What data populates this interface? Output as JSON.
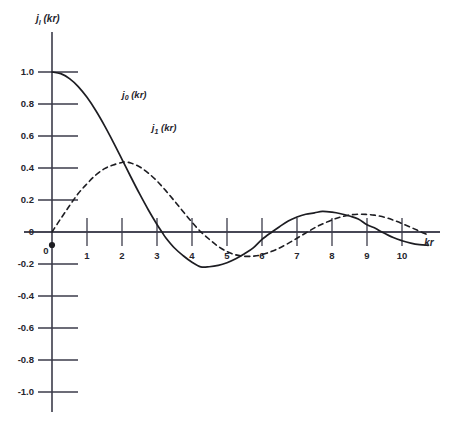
{
  "chart_data": {
    "type": "line",
    "title": "",
    "subtitle": "",
    "xlabel": "kr",
    "ylabel": "j (kr)",
    "xlim": [
      0,
      10.8
    ],
    "ylim": [
      -1.0,
      1.0
    ],
    "grid": false,
    "legend_position": "inline-annotation",
    "x_ticks": [
      "0",
      "1",
      "2",
      "3",
      "4",
      "5",
      "6",
      "7",
      "8",
      "9",
      "10"
    ],
    "x_tick_values": [
      0,
      1,
      2,
      3,
      4,
      5,
      6,
      7,
      8,
      9,
      10
    ],
    "y_ticks": [
      "1.0",
      "0.8",
      "0.6",
      "0.4",
      "0.2",
      "0",
      "-0.2",
      "-0.4",
      "-0.6",
      "-0.8",
      "-1.0"
    ],
    "y_tick_values": [
      1.0,
      0.8,
      0.6,
      0.4,
      0.2,
      0,
      -0.2,
      -0.4,
      -0.6,
      -0.8,
      -1.0
    ],
    "series": [
      {
        "name": "j0 (kr)",
        "name_base": "j",
        "name_sub": "0",
        "name_arg": " (kr)",
        "style": "solid",
        "label_x": 2.0,
        "label_y": 0.84,
        "x": [
          0.0,
          0.25,
          0.5,
          0.75,
          1.0,
          1.25,
          1.5,
          1.75,
          2.0,
          2.25,
          2.5,
          2.75,
          3.0,
          3.1416,
          3.25,
          3.5,
          3.75,
          4.0,
          4.25,
          4.4934,
          4.75,
          5.0,
          5.25,
          5.5,
          5.75,
          6.0,
          6.2832,
          6.5,
          6.75,
          7.0,
          7.25,
          7.5,
          7.7253,
          8.0,
          8.25,
          8.5,
          8.75,
          9.0,
          9.25,
          9.4248,
          9.75,
          10.0,
          10.25,
          10.5,
          10.75
        ],
        "y": [
          1.0,
          0.9896,
          0.9589,
          0.9089,
          0.8415,
          0.7592,
          0.665,
          0.5623,
          0.4546,
          0.3453,
          0.2394,
          0.1392,
          0.047,
          0.0,
          -0.0357,
          -0.1002,
          -0.1486,
          -0.1892,
          -0.2179,
          -0.2172,
          -0.2087,
          -0.1918,
          -0.1672,
          -0.1359,
          -0.0995,
          -0.0466,
          0.0,
          0.0331,
          0.0687,
          0.0939,
          0.1107,
          0.1196,
          0.1283,
          0.1237,
          0.1141,
          0.0998,
          0.0818,
          0.0456,
          0.0216,
          0.0,
          -0.0349,
          -0.0544,
          -0.0692,
          -0.0788,
          -0.083
        ],
        "markers": [
          {
            "kr": 0.0,
            "value": 1.0,
            "note": "maximum"
          },
          {
            "kr": 3.1416,
            "value": 0.0,
            "note": "first zero"
          },
          {
            "kr": 4.4934,
            "value": -0.2172,
            "note": "minimum"
          },
          {
            "kr": 6.2832,
            "value": 0.0,
            "note": "second zero"
          },
          {
            "kr": 7.7253,
            "value": 0.1284,
            "note": "second maximum"
          },
          {
            "kr": 9.4248,
            "value": 0.0,
            "note": "third zero"
          }
        ]
      },
      {
        "name": "j1 (kr)",
        "name_base": "j",
        "name_sub": "1",
        "name_arg": " (kr)",
        "style": "dashed",
        "label_x": 2.85,
        "label_y": 0.63,
        "x": [
          0.0,
          0.25,
          0.5,
          0.75,
          1.0,
          1.25,
          1.5,
          1.75,
          2.0,
          2.0816,
          2.25,
          2.5,
          2.75,
          3.0,
          3.25,
          3.5,
          3.75,
          4.0,
          4.25,
          4.4934,
          4.75,
          5.0,
          5.25,
          5.5,
          5.75,
          5.9404,
          6.25,
          6.5,
          6.75,
          7.0,
          7.25,
          7.5,
          7.7253,
          8.0,
          8.25,
          8.5,
          8.75,
          9.0,
          9.2058,
          9.5,
          9.75,
          10.0,
          10.25,
          10.5,
          10.75
        ],
        "y": [
          0.0,
          0.0831,
          0.164,
          0.2406,
          0.3012,
          0.3561,
          0.396,
          0.4191,
          0.435,
          0.4377,
          0.4313,
          0.4078,
          0.3684,
          0.3189,
          0.2585,
          0.1935,
          0.1266,
          0.061,
          0.0012,
          -0.0453,
          -0.0901,
          -0.1224,
          -0.1429,
          -0.152,
          -0.1509,
          -0.1447,
          -0.1233,
          -0.0998,
          -0.071,
          -0.0389,
          -0.0062,
          0.0259,
          0.05,
          0.0756,
          0.094,
          0.1061,
          0.1114,
          0.1096,
          0.1054,
          0.0923,
          0.0743,
          0.0529,
          0.0293,
          0.0049,
          -0.0192
        ],
        "markers": [
          {
            "kr": 0.0,
            "value": 0.0,
            "note": "origin"
          },
          {
            "kr": 2.0816,
            "value": 0.4377,
            "note": "first maximum"
          },
          {
            "kr": 4.4934,
            "value": 0.0,
            "note": "first zero"
          },
          {
            "kr": 5.9404,
            "value": -0.1443,
            "note": "minimum"
          },
          {
            "kr": 7.7253,
            "value": 0.0,
            "note": "second zero"
          },
          {
            "kr": 9.2058,
            "value": 0.1116,
            "note": "second maximum"
          },
          {
            "kr": 10.6,
            "value": 0.0,
            "note": "third zero"
          }
        ]
      }
    ]
  },
  "axes": {
    "y_title_base": "j",
    "y_title_sub": "l",
    "y_title_arg": " (kr)",
    "x_title": "kr",
    "origin_label": "0"
  }
}
